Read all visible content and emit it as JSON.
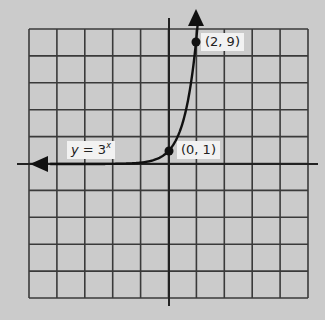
{
  "chart_data": {
    "type": "line",
    "title": "",
    "xlabel": "",
    "ylabel": "",
    "function": "y = 3^x",
    "series": [
      {
        "name": "y = 3^x",
        "x": [
          -5,
          -4,
          -3,
          -2,
          -1,
          0,
          1,
          2
        ],
        "values": [
          0.004,
          0.012,
          0.037,
          0.111,
          0.333,
          1,
          3,
          9
        ]
      }
    ],
    "labeled_points": [
      {
        "label": "(0, 1)",
        "x": 0,
        "y": 1
      },
      {
        "label": "(2, 9)",
        "x": 2,
        "y": 9
      }
    ],
    "grid": true,
    "grid_columns": 10,
    "grid_rows": 10,
    "axes_ticks_labeled": false,
    "arrows": [
      "left end of curve",
      "top end of curve"
    ]
  },
  "labels": {
    "equation_var": "y",
    "equation_eq": " = 3",
    "equation_exp": "x",
    "point_0_1": "(0, 1)",
    "point_2_9": "(2, 9)"
  },
  "colors": {
    "background": "#cbcbcb",
    "grid": "#3a3a3a",
    "curve": "#111111",
    "label_bg": "#f2f2f2"
  }
}
